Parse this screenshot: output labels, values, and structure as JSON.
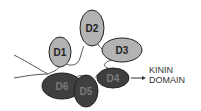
{
  "diagram": {
    "domains": [
      {
        "label": "D1",
        "shade": "light"
      },
      {
        "label": "D2",
        "shade": "light"
      },
      {
        "label": "D3",
        "shade": "light"
      },
      {
        "label": "D4",
        "shade": "dark"
      },
      {
        "label": "D5",
        "shade": "dark"
      },
      {
        "label": "D6",
        "shade": "dark"
      }
    ],
    "annotation": {
      "line1": "KININ",
      "line2": "DOMAIN"
    },
    "colors": {
      "light_fill": "#b3b3b3",
      "dark_fill": "#3f3f3f",
      "stroke": "#222222",
      "chain": "#555555"
    }
  }
}
